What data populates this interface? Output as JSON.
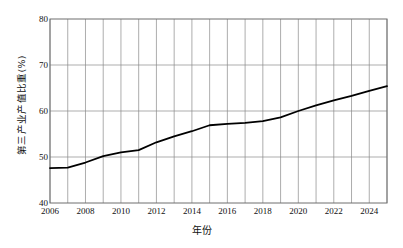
{
  "chart_data": {
    "type": "line",
    "title": "",
    "xlabel": "年份",
    "ylabel": "第三产业产值比重(%)",
    "xlim": [
      2006,
      2025
    ],
    "ylim": [
      40,
      80
    ],
    "yticks": [
      40,
      50,
      60,
      70,
      80
    ],
    "xticks": [
      2006,
      2008,
      2010,
      2012,
      2014,
      2016,
      2018,
      2020,
      2022,
      2024
    ],
    "grid": "both-major-and-minor-vertical-yearly",
    "legend": "none",
    "line_color": "#000000",
    "grid_color": "#8a8a8a",
    "axis_color": "#6e6e6e",
    "background": "#ffffff",
    "x": [
      2006,
      2007,
      2008,
      2009,
      2010,
      2011,
      2012,
      2013,
      2014,
      2015,
      2016,
      2017,
      2018,
      2019,
      2020,
      2021,
      2022,
      2023,
      2024,
      2025
    ],
    "series": [
      {
        "name": "第三产业产值比重",
        "values": [
          47.6,
          47.7,
          48.8,
          50.2,
          51.0,
          51.5,
          53.2,
          54.5,
          55.6,
          56.9,
          57.2,
          57.4,
          57.8,
          58.6,
          60.0,
          61.2,
          62.3,
          63.3,
          64.4,
          65.4
        ]
      }
    ]
  }
}
